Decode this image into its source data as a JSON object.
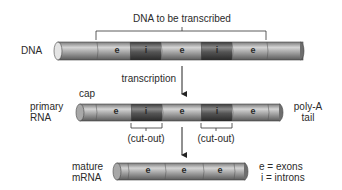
{
  "title": "DNA to be transcribed",
  "labels": {
    "dna": "DNA",
    "transcription": "transcription",
    "cap": "cap",
    "primary_rna_line1": "primary",
    "primary_rna_line2": "RNA",
    "poly_a_line1": "poly-A",
    "poly_a_line2": "tail",
    "cut_out_1": "(cut-out)",
    "cut_out_2": "(cut-out)",
    "mature_line1": "mature",
    "mature_line2": "mRNA"
  },
  "legend": {
    "exons": "e = exons",
    "introns": "i = introns"
  },
  "dna_segments": [
    "e",
    "i",
    "e",
    "i",
    "e"
  ],
  "primary_rna_segments": [
    "e",
    "i",
    "e",
    "i",
    "e"
  ],
  "mature_mrna_segments": [
    "e",
    "e",
    "e"
  ],
  "colors": {
    "exon": "#9a9a9a",
    "intron": "#4a4a4a",
    "line": "#333333"
  }
}
